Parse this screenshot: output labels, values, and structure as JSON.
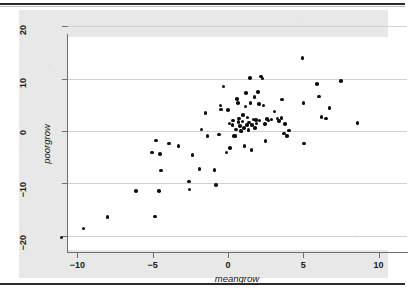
{
  "chart_data": {
    "type": "scatter",
    "title": "",
    "xlabel": "meangrow",
    "ylabel": "poorgrow",
    "xlim": [
      -11.6,
      10.7
    ],
    "ylim": [
      -21.5,
      21.5
    ],
    "xticks": [
      -10,
      -5,
      0,
      5,
      10
    ],
    "yticks": [
      20,
      10,
      0,
      -10,
      -20
    ],
    "xtick_labels": [
      "-10",
      "-5",
      "0",
      "5",
      "10"
    ],
    "ytick_labels": [
      "20",
      "10",
      "0",
      "-10",
      "-20"
    ],
    "grid": "horizontal",
    "legend": "none",
    "marker": "filled-circle",
    "marker_color": "#0d0d0d",
    "background_color": "#e8e8e8",
    "plot_background_color": "#ffffff",
    "gridline_color": "#d0d0d0",
    "axis_color": "#6d6d6d",
    "points": [
      [
        -11.05,
        -20.3
      ],
      [
        -9.6,
        -18.6
      ],
      [
        -8.0,
        -16.4
      ],
      [
        -6.1,
        -11.5
      ],
      [
        -4.85,
        -16.3
      ],
      [
        -4.8,
        -1.8
      ],
      [
        -4.6,
        -11.4
      ],
      [
        -4.45,
        -7.5
      ],
      [
        -4.5,
        -4.4
      ],
      [
        -5.05,
        -4.1
      ],
      [
        -3.9,
        -2.4
      ],
      [
        -3.3,
        -2.9
      ],
      [
        -2.55,
        -11.2
      ],
      [
        -2.6,
        -9.6
      ],
      [
        -2.35,
        -4.6
      ],
      [
        -1.9,
        -7.2
      ],
      [
        -1.75,
        0.3
      ],
      [
        -1.5,
        3.4
      ],
      [
        -1.35,
        -0.9
      ],
      [
        -0.9,
        -7.4
      ],
      [
        -0.8,
        -10.3
      ],
      [
        -0.6,
        -0.7
      ],
      [
        -0.5,
        4.9
      ],
      [
        -0.45,
        4.1
      ],
      [
        -0.3,
        8.5
      ],
      [
        -0.1,
        -4.1
      ],
      [
        0.0,
        4.0
      ],
      [
        0.1,
        1.4
      ],
      [
        0.15,
        -3.2
      ],
      [
        0.3,
        1.1
      ],
      [
        0.35,
        2.0
      ],
      [
        0.4,
        -0.9
      ],
      [
        0.5,
        -1.0
      ],
      [
        0.55,
        0.3
      ],
      [
        0.6,
        6.1
      ],
      [
        0.65,
        5.3
      ],
      [
        0.7,
        1.7
      ],
      [
        0.75,
        2.4
      ],
      [
        0.8,
        1.0
      ],
      [
        0.85,
        0.0
      ],
      [
        0.9,
        -0.1
      ],
      [
        0.95,
        1.8
      ],
      [
        1.0,
        3.1
      ],
      [
        1.05,
        0.6
      ],
      [
        1.1,
        -2.9
      ],
      [
        1.15,
        4.7
      ],
      [
        1.2,
        7.3
      ],
      [
        1.25,
        1.2
      ],
      [
        1.3,
        2.6
      ],
      [
        1.35,
        0.2
      ],
      [
        1.4,
        1.6
      ],
      [
        1.45,
        10.1
      ],
      [
        1.5,
        5.4
      ],
      [
        1.55,
        -3.6
      ],
      [
        1.6,
        1.1
      ],
      [
        1.7,
        2.2
      ],
      [
        1.75,
        6.5
      ],
      [
        1.8,
        0.6
      ],
      [
        1.85,
        2.1
      ],
      [
        1.9,
        1.4
      ],
      [
        2.0,
        7.4
      ],
      [
        2.05,
        5.2
      ],
      [
        2.1,
        2.0
      ],
      [
        2.2,
        10.4
      ],
      [
        2.3,
        10.0
      ],
      [
        2.35,
        4.9
      ],
      [
        2.45,
        1.3
      ],
      [
        2.5,
        -1.9
      ],
      [
        2.6,
        2.3
      ],
      [
        2.7,
        2.0
      ],
      [
        2.9,
        2.2
      ],
      [
        3.1,
        3.7
      ],
      [
        3.3,
        2.4
      ],
      [
        3.4,
        1.9
      ],
      [
        3.55,
        2.5
      ],
      [
        3.6,
        6.0
      ],
      [
        3.7,
        -0.5
      ],
      [
        3.8,
        1.3
      ],
      [
        3.9,
        -1.0
      ],
      [
        4.05,
        0.1
      ],
      [
        4.95,
        13.9
      ],
      [
        5.0,
        5.3
      ],
      [
        5.05,
        -2.4
      ],
      [
        5.9,
        9.0
      ],
      [
        6.05,
        6.6
      ],
      [
        6.2,
        2.7
      ],
      [
        6.5,
        2.4
      ],
      [
        6.75,
        4.4
      ],
      [
        7.5,
        9.5
      ],
      [
        8.6,
        1.5
      ]
    ]
  },
  "axis": {
    "ytitle": "poorgrow",
    "xtitle": "meangrow"
  }
}
